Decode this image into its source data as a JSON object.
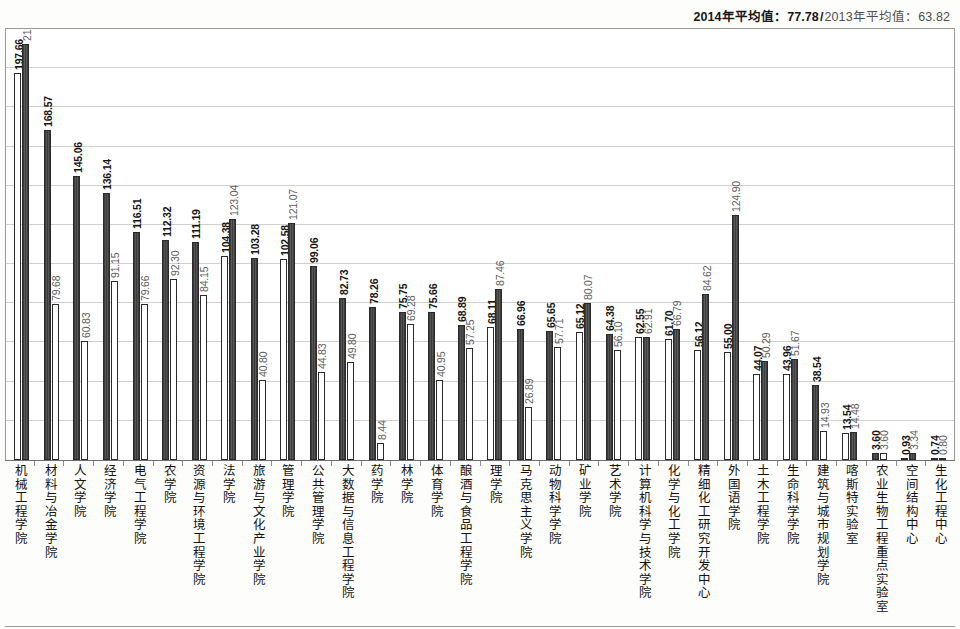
{
  "header": {
    "current_label": "2014年平均值：77.78",
    "separator": "/",
    "previous_label": "2013年平均值：63.82"
  },
  "chart_data": {
    "type": "bar",
    "title": "",
    "subtitle": "",
    "xlabel": "",
    "ylabel": "",
    "ylim": [
      0,
      220
    ],
    "grid": true,
    "gridline_step": 20,
    "legend_position": "top-right",
    "axis_tick_labels_visible": false,
    "categories": [
      "机械工程学院",
      "材料与冶金学院",
      "人文学院",
      "经济学院",
      "电气工程学院",
      "农学院",
      "资源与环境工程学院",
      "法学院",
      "旅游与文化产业学院",
      "管理学院",
      "公共管理学院",
      "大数据与信息工程学院",
      "药学院",
      "林学院",
      "体育学院",
      "酿酒与食品工程学院",
      "理学院",
      "马克思主义学院",
      "动物科学学院",
      "矿业学院",
      "艺术学院",
      "计算机科学与技术学院",
      "化学与化工学院",
      "精细化工研究开发中心",
      "外国语学院",
      "土木工程学院",
      "生命科学学院",
      "建筑与城市规划学院",
      "喀斯特实验室",
      "农业生物工程重点实验室",
      "空间结构中心",
      "生化工程中心"
    ],
    "series": [
      {
        "name": "2014年",
        "average": 77.78,
        "values": [
          197.66,
          168.57,
          145.06,
          136.14,
          116.51,
          112.32,
          111.19,
          104.38,
          103.28,
          102.58,
          99.06,
          82.73,
          78.26,
          75.75,
          75.66,
          68.89,
          68.11,
          66.96,
          65.65,
          65.12,
          64.38,
          62.55,
          61.7,
          56.12,
          55.0,
          44.07,
          43.96,
          38.54,
          13.54,
          3.6,
          0.93,
          0.74
        ]
      },
      {
        "name": "2013年",
        "average": 63.82,
        "values": [
          212.5,
          79.68,
          60.83,
          91.15,
          79.66,
          92.3,
          84.15,
          123.04,
          40.8,
          121.07,
          44.83,
          49.8,
          8.44,
          69.28,
          40.95,
          57.25,
          87.46,
          26.89,
          57.71,
          80.07,
          56.1,
          62.91,
          66.79,
          84.62,
          124.9,
          50.29,
          51.67,
          14.93,
          14.48,
          3.6,
          3.34,
          0.8
        ]
      }
    ]
  }
}
